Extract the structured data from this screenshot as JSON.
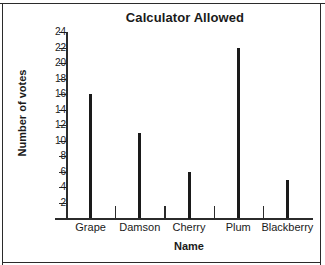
{
  "chart_data": {
    "type": "bar",
    "title": "Calculator Allowed",
    "xlabel": "Name",
    "ylabel": "Number of votes",
    "categories": [
      "Grape",
      "Damson",
      "Cherry",
      "Plum",
      "Blackberry"
    ],
    "values": [
      16,
      11,
      6,
      22,
      5
    ],
    "ylim": [
      0,
      24
    ],
    "ytick_labels": [
      "24",
      "22",
      "20",
      "18",
      "16",
      "14",
      "12",
      "10",
      "8",
      "6",
      "4",
      "2"
    ],
    "ytick_values": [
      24,
      22,
      20,
      18,
      16,
      14,
      12,
      10,
      8,
      6,
      4,
      2
    ],
    "grid": false,
    "legend": false,
    "bar_color": "#1a1a1a",
    "axis_color": "#2b2b2b",
    "background": "#ffffff"
  }
}
